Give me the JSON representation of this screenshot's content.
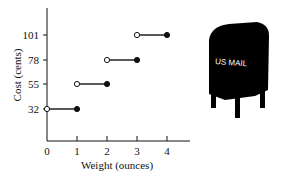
{
  "chart_data": {
    "type": "line",
    "subtype": "step",
    "title": "",
    "xlabel": "Weight (ounces)",
    "ylabel": "Cost (cents)",
    "xticks": [
      0,
      1,
      2,
      3,
      4
    ],
    "yticks": [
      32,
      55,
      78,
      101
    ],
    "xlim": [
      0,
      4.7
    ],
    "series": [
      {
        "name": "Postage cost",
        "segments": [
          {
            "x_start": 0,
            "x_end": 1,
            "y": 32,
            "start": "open",
            "end": "closed"
          },
          {
            "x_start": 1,
            "x_end": 2,
            "y": 55,
            "start": "open",
            "end": "closed"
          },
          {
            "x_start": 2,
            "x_end": 3,
            "y": 78,
            "start": "open",
            "end": "closed"
          },
          {
            "x_start": 3,
            "x_end": 4,
            "y": 101,
            "start": "open",
            "end": "closed"
          }
        ]
      }
    ],
    "grid": false,
    "legend": null
  },
  "illustration": {
    "label": "US MAIL",
    "icon": "mailbox-icon"
  }
}
